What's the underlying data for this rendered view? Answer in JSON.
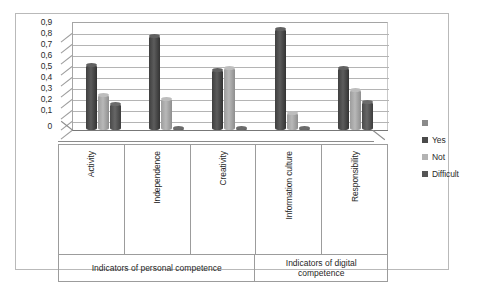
{
  "chart_data": {
    "type": "bar",
    "title": "",
    "subtitle": "",
    "xlabel": "",
    "ylabel": "",
    "ylim": [
      0,
      0.9
    ],
    "grid": true,
    "legend_position": "right",
    "y_ticks": [
      "0,9",
      "0,8",
      "0,7",
      "0,6",
      "0,5",
      "0,4",
      "0,3",
      "0,2",
      "0,1",
      "0"
    ],
    "y_tick_values": [
      0.9,
      0.8,
      0.7,
      0.6,
      0.5,
      0.4,
      0.3,
      0.2,
      0.1,
      0
    ],
    "categories": [
      "Activity",
      "Independence",
      "Creativity",
      "Information culture",
      "Responsibility"
    ],
    "series": [
      {
        "name": "Yes",
        "color": "#4a4a4a",
        "values": [
          0.54,
          0.78,
          0.5,
          0.84,
          0.52
        ]
      },
      {
        "name": "Not",
        "color": "#aeaeae",
        "values": [
          0.29,
          0.26,
          0.52,
          0.14,
          0.33
        ]
      },
      {
        "name": "Difficult",
        "color": "#555555",
        "values": [
          0.22,
          0.02,
          0.02,
          0.02,
          0.23
        ]
      }
    ],
    "category_groups": [
      {
        "label": "Indicators of personal competence",
        "categories": [
          "Activity",
          "Independence",
          "Creativity"
        ]
      },
      {
        "label": "Indicators of digital competence",
        "categories": [
          "Information culture",
          "Responsibility"
        ]
      }
    ]
  },
  "legend": {
    "items": [
      {
        "label": "",
        "color": "#8a8a8a"
      },
      {
        "label": "Yes",
        "color": "#4a4a4a"
      },
      {
        "label": "Not",
        "color": "#b3b3b3"
      },
      {
        "label": "Difficult",
        "color": "#555555"
      }
    ]
  },
  "group_labels": {
    "personal": "Indicators of personal competence",
    "digital_line1": "Indicators of digital",
    "digital_line2": "competence"
  }
}
